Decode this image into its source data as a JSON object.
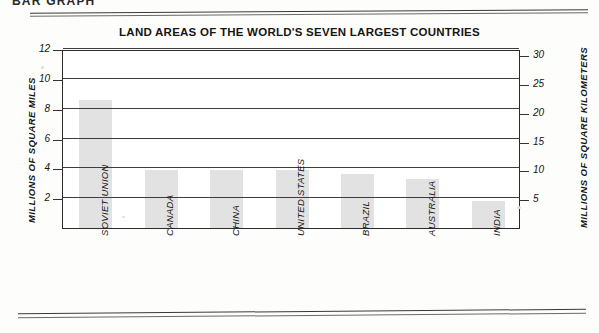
{
  "page": {
    "heading": "BAR GRAPH"
  },
  "chart_data": {
    "type": "bar",
    "title": "LAND AREAS OF THE WORLD'S SEVEN LARGEST COUNTRIES",
    "categories": [
      "SOVIET UNION",
      "CANADA",
      "CHINA",
      "UNITED STATES",
      "BRAZIL",
      "AUSTRALIA",
      "INDIA"
    ],
    "values": [
      8.6,
      3.9,
      3.9,
      3.9,
      3.6,
      3.3,
      1.8
    ],
    "xlabel": "",
    "ylabel": "MILLIONS OF SQUARE MILES",
    "ylim": [
      0,
      12
    ],
    "yticks": [
      2,
      4,
      6,
      8,
      10,
      12
    ],
    "y2label": "MILLIONS OF SQUARE KILOMETERS",
    "y2lim": [
      0,
      31.08
    ],
    "y2ticks": [
      5,
      10,
      15,
      20,
      25,
      30
    ],
    "grid": true,
    "legend": "none",
    "bar_color": "#e2e2e2",
    "axis_color": "#2b2b2b"
  }
}
